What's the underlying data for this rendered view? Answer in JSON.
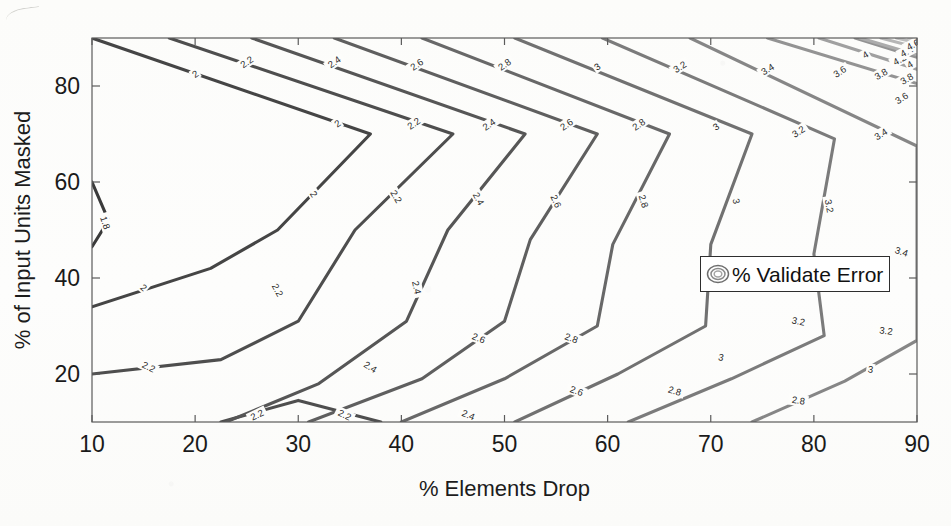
{
  "figure": {
    "axis": {
      "xlabel": "% Elements Drop",
      "ylabel": "% of Input Units Masked",
      "xticks": [
        "10",
        "20",
        "30",
        "40",
        "50",
        "60",
        "70",
        "80",
        "90"
      ],
      "yticks": [
        "20",
        "40",
        "60",
        "80"
      ]
    },
    "legend": {
      "label": "% Validate Error",
      "icon": "contour-rings-icon"
    }
  },
  "chart_data": {
    "type": "contour",
    "title": "",
    "xlabel": "% Elements Drop",
    "ylabel": "% of Input Units Masked",
    "xlim": [
      10,
      90
    ],
    "ylim": [
      10,
      90
    ],
    "xticks": [
      10,
      20,
      30,
      40,
      50,
      60,
      70,
      80,
      90
    ],
    "yticks": [
      20,
      40,
      60,
      80
    ],
    "grid": false,
    "legend": "% Validate Error",
    "legend_position": "center-right",
    "zlabel": "% Validate Error",
    "levels": [
      1.8,
      2,
      2.2,
      2.4,
      2.6,
      2.8,
      3,
      3.2,
      3.4,
      3.6,
      3.8,
      4,
      4.2,
      4.4,
      4.6
    ],
    "colormap": "gray-dark-to-light (low=dark, high=light)",
    "level_colors": {
      "1.8": "#3a3a3a",
      "2": "#454545",
      "2.2": "#4e4e4e",
      "2.4": "#565656",
      "2.6": "#5f5f5f",
      "2.8": "#686868",
      "3": "#717171",
      "3.2": "#7b7b7b",
      "3.4": "#868686",
      "3.6": "#939393",
      "3.8": "#a0a0a0",
      "4": "#acacac",
      "4.2": "#b6b6b6",
      "4.4": "#bebebe",
      "4.6": "#c6c6c6"
    },
    "contours": [
      {
        "level": 1.8,
        "label": "1.8",
        "paths": [
          [
            [
              10,
              60
            ],
            [
              11.6,
              52
            ],
            [
              10,
              46.5
            ]
          ]
        ]
      },
      {
        "level": 2,
        "label": "2",
        "paths": [
          [
            [
              10,
              90
            ],
            [
              37,
              70
            ],
            [
              28,
              50
            ],
            [
              21.5,
              42
            ],
            [
              10,
              34
            ]
          ]
        ]
      },
      {
        "level": 2.2,
        "label": "2.2",
        "paths": [
          [
            [
              17.5,
              90
            ],
            [
              45,
              70
            ],
            [
              35.5,
              50
            ],
            [
              30,
              31
            ],
            [
              22.5,
              23
            ],
            [
              10,
              20
            ]
          ],
          [
            [
              22.5,
              10
            ],
            [
              30,
              14.5
            ],
            [
              38,
              10
            ]
          ]
        ]
      },
      {
        "level": 2.4,
        "label": "2.4",
        "paths": [
          [
            [
              25.5,
              90
            ],
            [
              52,
              70
            ],
            [
              44.5,
              50
            ],
            [
              40.5,
              31
            ],
            [
              32,
              18
            ],
            [
              23,
              10
            ]
          ]
        ]
      },
      {
        "level": 2.6,
        "label": "2.6",
        "paths": [
          [
            [
              33.5,
              90
            ],
            [
              59,
              70
            ],
            [
              52.5,
              48
            ],
            [
              50,
              31
            ],
            [
              42,
              19
            ],
            [
              31,
              10
            ]
          ]
        ]
      },
      {
        "level": 2.8,
        "label": "2.8",
        "paths": [
          [
            [
              42,
              90
            ],
            [
              66,
              70
            ],
            [
              60.5,
              47
            ],
            [
              59,
              30
            ],
            [
              50,
              19
            ],
            [
              40,
              10
            ]
          ]
        ]
      },
      {
        "level": 3,
        "label": "3",
        "paths": [
          [
            [
              51,
              90
            ],
            [
              74,
              70
            ],
            [
              70,
              47
            ],
            [
              69.5,
              30
            ],
            [
              61,
              20
            ],
            [
              51,
              10
            ]
          ]
        ]
      },
      {
        "level": 3.2,
        "label": "3.2",
        "paths": [
          [
            [
              59.5,
              90
            ],
            [
              82,
              69
            ],
            [
              80,
              45
            ],
            [
              81,
              28
            ],
            [
              72,
              19
            ],
            [
              62,
              10
            ]
          ]
        ]
      },
      {
        "level": 3.4,
        "label": "3.4",
        "paths": [
          [
            [
              68,
              90
            ],
            [
              90,
              67.5
            ],
            [
              90,
              44
            ],
            [
              90,
              27
            ],
            [
              83,
              18.5
            ],
            [
              74,
              10
            ]
          ]
        ]
      },
      {
        "level": 3.6,
        "label": "3.6",
        "paths": [
          [
            [
              75.5,
              90
            ],
            [
              90,
              80.5
            ]
          ],
          [
            [
              84,
              90
            ],
            [
              90,
              86
            ]
          ]
        ]
      },
      {
        "level": 3.8,
        "label": "3.8",
        "paths": [
          [
            [
              80.5,
              90
            ],
            [
              90,
              83.5
            ]
          ]
        ]
      },
      {
        "level": 4,
        "label": "4",
        "paths": [
          [
            [
              84.5,
              90
            ],
            [
              90,
              86.5
            ]
          ]
        ]
      },
      {
        "level": 4.2,
        "label": "4.2",
        "paths": [
          [
            [
              86.5,
              90
            ],
            [
              90,
              88
            ]
          ]
        ]
      },
      {
        "level": 4.4,
        "label": "4.4",
        "paths": [
          [
            [
              88,
              90
            ],
            [
              90,
              89
            ]
          ]
        ]
      },
      {
        "level": 4.6,
        "label": "4.6",
        "paths": [
          [
            [
              89.2,
              90
            ],
            [
              90,
              89.6
            ]
          ]
        ]
      }
    ],
    "contour_label_positions": [
      {
        "level": 1.8,
        "text": "1.8",
        "x": 11.3,
        "y": 51.5,
        "rot": 72
      },
      {
        "level": 2,
        "text": "2",
        "x": 20.0,
        "y": 82.5,
        "rot": -35
      },
      {
        "level": 2,
        "text": "2",
        "x": 33.8,
        "y": 72.2,
        "rot": -35
      },
      {
        "level": 2,
        "text": "2",
        "x": 31.5,
        "y": 57.5,
        "rot": 57
      },
      {
        "level": 2,
        "text": "2",
        "x": 15.0,
        "y": 38.0,
        "rot": 40
      },
      {
        "level": 2.2,
        "text": "2.2",
        "x": 25.0,
        "y": 85.0,
        "rot": -35
      },
      {
        "level": 2.2,
        "text": "2.2",
        "x": 41.2,
        "y": 72.2,
        "rot": -35
      },
      {
        "level": 2.2,
        "text": "2.2",
        "x": 39.5,
        "y": 57.0,
        "rot": 60
      },
      {
        "level": 2.2,
        "text": "2.2",
        "x": 28.0,
        "y": 37.5,
        "rot": 62
      },
      {
        "level": 2.2,
        "text": "2.2",
        "x": 15.5,
        "y": 21.5,
        "rot": 26
      },
      {
        "level": 2.2,
        "text": "2.2",
        "x": 26.0,
        "y": 11.5,
        "rot": -26
      },
      {
        "level": 2.2,
        "text": "2.2",
        "x": 34.5,
        "y": 11.5,
        "rot": 26
      },
      {
        "level": 2.4,
        "text": "2.4",
        "x": 33.5,
        "y": 85.0,
        "rot": -35
      },
      {
        "level": 2.4,
        "text": "2.4",
        "x": 48.5,
        "y": 72.0,
        "rot": -35
      },
      {
        "level": 2.4,
        "text": "2.4",
        "x": 47.5,
        "y": 56.5,
        "rot": 62
      },
      {
        "level": 2.4,
        "text": "2.4",
        "x": 41.5,
        "y": 38.0,
        "rot": 78
      },
      {
        "level": 2.4,
        "text": "2.4",
        "x": 37.0,
        "y": 21.5,
        "rot": 32
      },
      {
        "level": 2.4,
        "text": "2.4",
        "x": 46.5,
        "y": 11.5,
        "rot": 22
      },
      {
        "level": 2.6,
        "text": "2.6",
        "x": 41.5,
        "y": 84.5,
        "rot": -35
      },
      {
        "level": 2.6,
        "text": "2.6",
        "x": 56.0,
        "y": 72.0,
        "rot": -35
      },
      {
        "level": 2.6,
        "text": "2.6",
        "x": 55.0,
        "y": 56.0,
        "rot": 66
      },
      {
        "level": 2.6,
        "text": "2.6",
        "x": 47.5,
        "y": 27.5,
        "rot": 22
      },
      {
        "level": 2.6,
        "text": "2.6",
        "x": 57.0,
        "y": 16.5,
        "rot": 20
      },
      {
        "level": 2.8,
        "text": "2.8",
        "x": 50.0,
        "y": 84.5,
        "rot": -35
      },
      {
        "level": 2.8,
        "text": "2.8",
        "x": 63.0,
        "y": 72.0,
        "rot": -35
      },
      {
        "level": 2.8,
        "text": "2.8",
        "x": 63.5,
        "y": 56.0,
        "rot": 72
      },
      {
        "level": 2.8,
        "text": "2.8",
        "x": 56.5,
        "y": 27.5,
        "rot": 20
      },
      {
        "level": 2.8,
        "text": "2.8",
        "x": 66.5,
        "y": 16.5,
        "rot": 16
      },
      {
        "level": 2.8,
        "text": "2.8",
        "x": 78.5,
        "y": 14.5,
        "rot": 8
      },
      {
        "level": 3,
        "text": "3",
        "x": 59.0,
        "y": 84.0,
        "rot": -35
      },
      {
        "level": 3,
        "text": "3",
        "x": 70.5,
        "y": 71.5,
        "rot": -35
      },
      {
        "level": 3,
        "text": "3",
        "x": 72.5,
        "y": 56.0,
        "rot": 78
      },
      {
        "level": 3,
        "text": "3",
        "x": 71.0,
        "y": 23.5,
        "rot": 12
      },
      {
        "level": 3,
        "text": "3",
        "x": 85.5,
        "y": 21.0,
        "rot": 8
      },
      {
        "level": 3.2,
        "text": "3.2",
        "x": 67.0,
        "y": 84.0,
        "rot": -33
      },
      {
        "level": 3.2,
        "text": "3.2",
        "x": 78.5,
        "y": 70.5,
        "rot": -33
      },
      {
        "level": 3.2,
        "text": "3.2",
        "x": 81.5,
        "y": 55.0,
        "rot": 80
      },
      {
        "level": 3.2,
        "text": "3.2",
        "x": 78.5,
        "y": 31.0,
        "rot": 12
      },
      {
        "level": 3.2,
        "text": "3.2",
        "x": 87.0,
        "y": 29.0,
        "rot": 8
      },
      {
        "level": 3.4,
        "text": "3.4",
        "x": 75.5,
        "y": 83.5,
        "rot": -32
      },
      {
        "level": 3.4,
        "text": "3.4",
        "x": 86.5,
        "y": 70.0,
        "rot": -32
      },
      {
        "level": 3.4,
        "text": "3.4",
        "x": 88.5,
        "y": 45.5,
        "rot": 18
      },
      {
        "level": 3.6,
        "text": "3.6",
        "x": 82.5,
        "y": 83.0,
        "rot": -32
      },
      {
        "level": 3.6,
        "text": "3.6",
        "x": 88.5,
        "y": 77.5,
        "rot": -32
      },
      {
        "level": 3.8,
        "text": "3.8",
        "x": 86.5,
        "y": 82.5,
        "rot": -30
      },
      {
        "level": 3.8,
        "text": "3.8",
        "x": 89.0,
        "y": 81.5,
        "rot": -30
      },
      {
        "level": 4,
        "text": "4",
        "x": 85.0,
        "y": 86.5,
        "rot": -30
      },
      {
        "level": 4,
        "text": "4",
        "x": 89.3,
        "y": 84.5,
        "rot": -30
      },
      {
        "level": 4.2,
        "text": "4.2",
        "x": 88.3,
        "y": 85.5,
        "rot": -28
      },
      {
        "level": 4.4,
        "text": "4.4",
        "x": 89.0,
        "y": 87.2,
        "rot": -28
      },
      {
        "level": 4.6,
        "text": "4.6",
        "x": 89.6,
        "y": 88.6,
        "rot": -28
      }
    ]
  }
}
